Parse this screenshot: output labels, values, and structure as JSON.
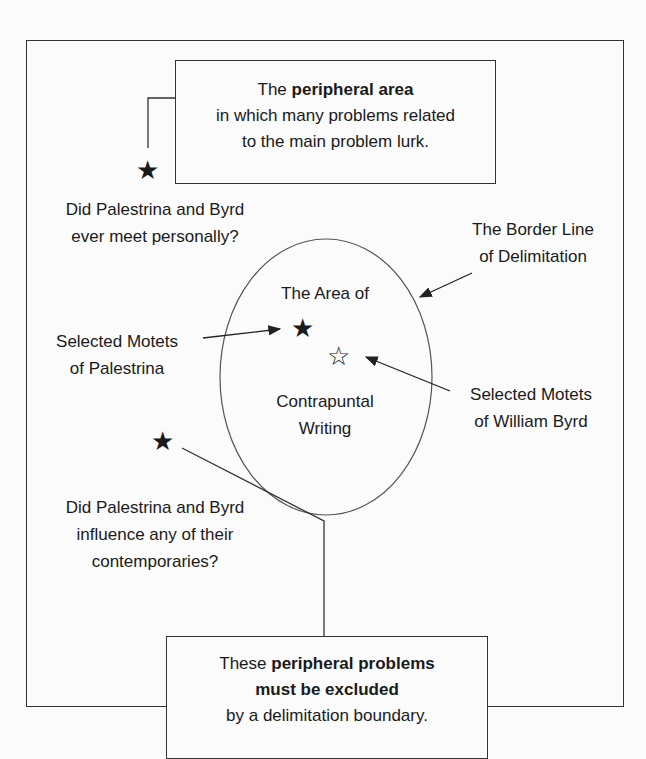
{
  "top_box": {
    "line1_pre": "The ",
    "line1_bold": "peripheral area",
    "line2": "in which many problems related",
    "line3": "to the main problem lurk."
  },
  "question1": {
    "line1": "Did Palestrina and Byrd",
    "line2": "ever meet personally?"
  },
  "border_label": {
    "line1": "The Border Line",
    "line2": "of Delimitation"
  },
  "circle": {
    "line1": "The Area of",
    "line2": "Contrapuntal",
    "line3": "Writing"
  },
  "palestrina_label": {
    "line1": "Selected Motets",
    "line2": "of Palestrina"
  },
  "byrd_label": {
    "line1": "Selected Motets",
    "line2": "of William Byrd"
  },
  "question2": {
    "line1": "Did Palestrina and Byrd",
    "line2": "influence any of their",
    "line3": "contemporaries?"
  },
  "bottom_box": {
    "line1_pre": "These ",
    "line1_bold": "peripheral problems",
    "line2_bold": "must be excluded",
    "line3": "by a delimitation boundary."
  },
  "stars": {
    "filled": "★",
    "outline": "☆"
  }
}
